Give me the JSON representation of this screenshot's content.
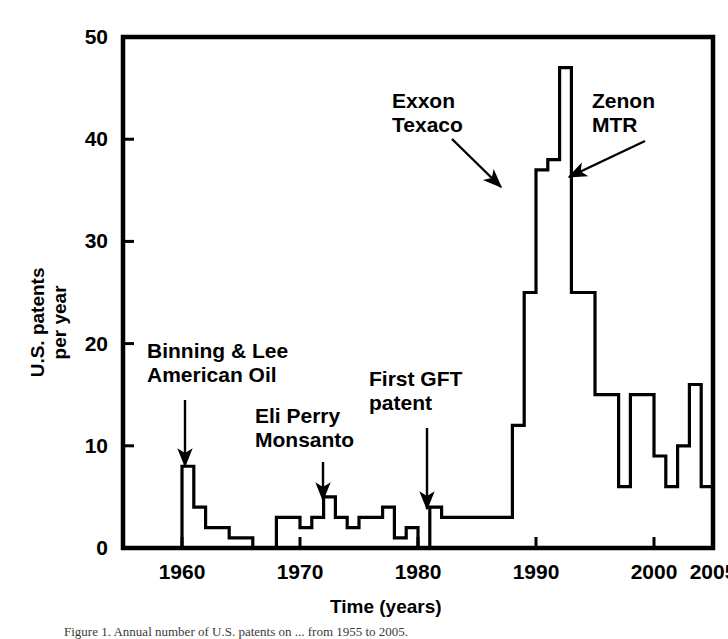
{
  "figure": {
    "axes": {
      "x_title": "Time (years)",
      "y_title": "U.S. patents\nper year",
      "x_ticks": [
        "1960",
        "1970",
        "1980",
        "1990",
        "2000",
        "2005"
      ],
      "x_tick_values": [
        1960,
        1970,
        1980,
        1990,
        2000,
        2005
      ],
      "y_ticks": [
        "0",
        "10",
        "20",
        "30",
        "40",
        "50"
      ],
      "y_tick_values": [
        0,
        10,
        20,
        30,
        40,
        50
      ]
    },
    "annotations": [
      {
        "id": "binning-lee",
        "text": "Binning & Lee\nAmerican Oil",
        "x": 147,
        "y": 341,
        "arrow": {
          "x1": 185,
          "y1": 400,
          "x2": 185,
          "y2": 466
        }
      },
      {
        "id": "eli-perry",
        "text": "Eli Perry\nMonsanto",
        "x": 255,
        "y": 406,
        "arrow": {
          "x1": 323,
          "y1": 462,
          "x2": 323,
          "y2": 500
        }
      },
      {
        "id": "first-gft",
        "text": "First GFT\npatent",
        "x": 369,
        "y": 369,
        "arrow": {
          "x1": 427,
          "y1": 428,
          "x2": 427,
          "y2": 509
        }
      },
      {
        "id": "exxon-texaco",
        "text": "Exxon\nTexaco",
        "x": 392,
        "y": 91,
        "arrow": {
          "x1": 452,
          "y1": 139,
          "x2": 501,
          "y2": 187
        }
      },
      {
        "id": "zenon-mtr",
        "text": "Zenon\nMTR",
        "x": 592,
        "y": 91,
        "arrow": {
          "x1": 645,
          "y1": 141,
          "x2": 569,
          "y2": 177
        }
      }
    ],
    "caption": "Figure 1. Annual number of U.S. patents on ... from 1955 to 2005."
  },
  "chart_data": {
    "type": "line",
    "subtype": "step-histogram",
    "title": "",
    "xlabel": "Time (years)",
    "ylabel": "U.S. patents per year",
    "xlim": [
      1955,
      2005
    ],
    "ylim": [
      0,
      50
    ],
    "grid": false,
    "legend": "none",
    "x": [
      1955,
      1956,
      1957,
      1958,
      1959,
      1960,
      1961,
      1962,
      1963,
      1964,
      1965,
      1966,
      1967,
      1968,
      1969,
      1970,
      1971,
      1972,
      1973,
      1974,
      1975,
      1976,
      1977,
      1978,
      1979,
      1980,
      1981,
      1982,
      1983,
      1984,
      1985,
      1986,
      1987,
      1988,
      1989,
      1990,
      1991,
      1992,
      1993,
      1994,
      1995,
      1996,
      1997,
      1998,
      1999,
      2000,
      2001,
      2002,
      2003,
      2004
    ],
    "values": [
      0,
      0,
      0,
      0,
      0,
      8,
      4,
      2,
      2,
      1,
      1,
      0,
      0,
      3,
      3,
      2,
      3,
      5,
      3,
      2,
      3,
      3,
      4,
      1,
      2,
      0,
      4,
      3,
      3,
      3,
      3,
      3,
      3,
      12,
      25,
      37,
      38,
      47,
      25,
      25,
      15,
      15,
      6,
      15,
      15,
      9,
      6,
      10,
      16,
      6
    ],
    "annotations": [
      {
        "label": "Binning & Lee / American Oil",
        "x": 1960
      },
      {
        "label": "Eli Perry / Monsanto",
        "x": 1973
      },
      {
        "label": "First GFT patent",
        "x": 1982
      },
      {
        "label": "Exxon / Texaco",
        "x": 1989
      },
      {
        "label": "Zenon / MTR",
        "x": 1992
      }
    ]
  }
}
